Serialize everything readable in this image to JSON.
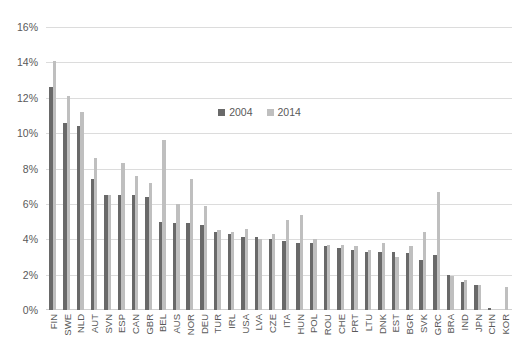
{
  "chart_data": {
    "type": "bar",
    "title": "",
    "subtitle": "",
    "xlabel": "",
    "ylabel": "",
    "ylim": [
      0,
      16
    ],
    "ytick_labels": [
      "16%",
      "14%",
      "12%",
      "10%",
      "8%",
      "6%",
      "4%",
      "2%",
      "0%"
    ],
    "ytick_values": [
      16,
      14,
      12,
      10,
      8,
      6,
      4,
      2,
      0
    ],
    "grid": true,
    "legend_position": "top-center",
    "value_unit": "%",
    "categories": [
      "FIN",
      "SWE",
      "NLD",
      "AUT",
      "SVN",
      "ESP",
      "CAN",
      "GBR",
      "BEL",
      "AUS",
      "NOR",
      "DEU",
      "TUR",
      "IRL",
      "USA",
      "LVA",
      "CZE",
      "ITA",
      "HUN",
      "POL",
      "ROU",
      "CHE",
      "PRT",
      "LTU",
      "DNK",
      "EST",
      "BGR",
      "SVK",
      "GRC",
      "BRA",
      "IND",
      "JPN",
      "CHN",
      "KOR"
    ],
    "series": [
      {
        "name": "2004",
        "color": "#696969",
        "values": [
          12.6,
          10.6,
          10.4,
          7.4,
          6.5,
          6.5,
          6.5,
          6.4,
          5.0,
          4.9,
          4.9,
          4.8,
          4.4,
          4.3,
          4.1,
          4.1,
          4.0,
          3.9,
          3.8,
          3.8,
          3.6,
          3.5,
          3.4,
          3.3,
          3.3,
          3.3,
          3.2,
          2.8,
          3.1,
          2.0,
          1.6,
          1.4,
          0.1,
          0.0
        ]
      },
      {
        "name": "2014",
        "color": "#bfbfbf",
        "values": [
          14.1,
          12.1,
          11.2,
          8.6,
          6.5,
          8.3,
          7.6,
          7.2,
          9.6,
          6.0,
          7.4,
          5.9,
          4.5,
          4.4,
          4.6,
          4.0,
          4.3,
          5.1,
          5.4,
          4.0,
          3.7,
          3.7,
          3.6,
          3.4,
          3.8,
          3.0,
          3.6,
          4.4,
          6.7,
          1.9,
          1.7,
          1.4,
          0.0,
          1.3
        ]
      }
    ]
  },
  "legend": {
    "items": [
      {
        "label": "2004",
        "series": "2004"
      },
      {
        "label": "2014",
        "series": "2014"
      }
    ]
  }
}
